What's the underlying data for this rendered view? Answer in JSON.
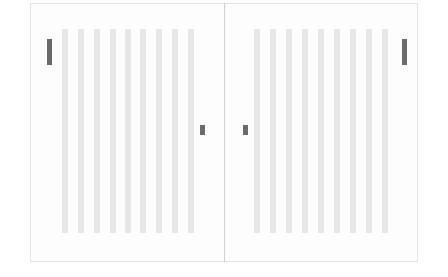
{
  "layout": {
    "panels": [
      {
        "name": "left",
        "stripes_x": [
          62,
          78,
          94,
          110,
          125,
          140,
          156,
          172,
          188
        ],
        "tall_marker": {
          "x": 47,
          "y": 39
        },
        "small_marker": {
          "x": 200,
          "y": 125
        }
      },
      {
        "name": "right",
        "stripes_x": [
          254,
          270,
          286,
          302,
          318,
          334,
          350,
          366,
          382
        ],
        "tall_marker": {
          "x": 402,
          "y": 39
        },
        "small_marker": {
          "x": 243,
          "y": 125
        }
      }
    ],
    "colors": {
      "stripe": "#e7e7e7",
      "marker": "#6a6a6a",
      "divider": "#cfcfcf",
      "border": "#e4e4e4"
    }
  }
}
